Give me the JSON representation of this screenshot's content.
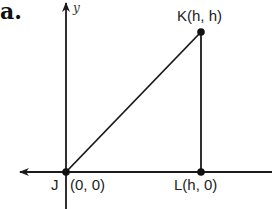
{
  "part_label": "a.",
  "axes": {
    "x_label": "",
    "y_label": "y"
  },
  "points": [
    {
      "name": "J",
      "label": "J",
      "coords": "(0, 0)",
      "x": 66,
      "y": 172
    },
    {
      "name": "K",
      "label": "K(h, h)",
      "coords": "(h, h)",
      "x": 201,
      "y": 32
    },
    {
      "name": "L",
      "label": "L(h, 0)",
      "coords": "(h, 0)",
      "x": 201,
      "y": 172
    }
  ],
  "labels": {
    "J_letter": "J",
    "J_coords": "(0, 0)",
    "K": "K(h, h)",
    "L": "L(h, 0)"
  },
  "segments": [
    {
      "from": "J",
      "to": "K"
    },
    {
      "from": "K",
      "to": "L"
    }
  ],
  "colors": {
    "line": "#1a1a1a",
    "text": "#222222"
  }
}
